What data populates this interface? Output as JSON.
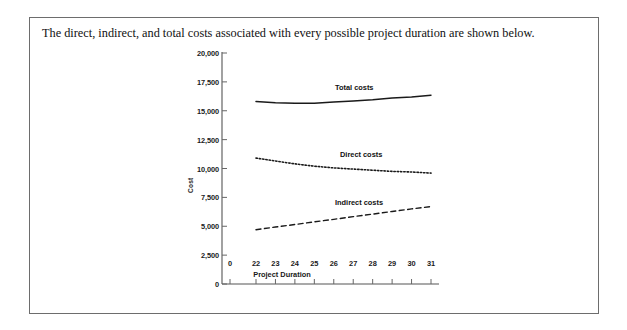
{
  "caption": "The direct, indirect, and total costs associated with every possible project duration are shown below.",
  "chart_data": {
    "type": "line",
    "title": "",
    "xlabel": "Project Duration",
    "ylabel": "Cost",
    "xlim": [
      21.25,
      31.5
    ],
    "ylim": [
      0,
      20000
    ],
    "grid": false,
    "legend_position": "inline-labels",
    "x_tick_labels": [
      "0",
      "22",
      "23",
      "24",
      "25",
      "26",
      "27",
      "28",
      "29",
      "30",
      "31"
    ],
    "y_tick_labels": [
      "0",
      "2,500",
      "5,000",
      "7,500",
      "10,000",
      "12,500",
      "15,000",
      "17,500",
      "20,000"
    ],
    "y_tick_values": [
      0,
      2500,
      5000,
      7500,
      10000,
      12500,
      15000,
      17500,
      20000
    ],
    "x": [
      22,
      23,
      24,
      25,
      26,
      27,
      28,
      29,
      30,
      31
    ],
    "series": [
      {
        "name": "Total costs",
        "style": "solid",
        "color": "#1a1a1a",
        "values": [
          15800,
          15700,
          15650,
          15650,
          15750,
          15850,
          15950,
          16100,
          16200,
          16350
        ]
      },
      {
        "name": "Direct costs",
        "style": "dotted",
        "color": "#1a1a1a",
        "values": [
          10900,
          10650,
          10400,
          10200,
          10050,
          9950,
          9850,
          9750,
          9700,
          9600
        ]
      },
      {
        "name": "Indirect costs",
        "style": "dashed",
        "color": "#1a1a1a",
        "values": [
          4700,
          4930,
          5150,
          5380,
          5600,
          5830,
          6050,
          6280,
          6500,
          6700
        ]
      }
    ]
  }
}
